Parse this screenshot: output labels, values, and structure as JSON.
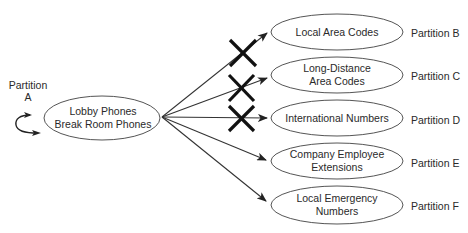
{
  "diagram": {
    "source": {
      "partition_label": [
        "Partition",
        "A"
      ],
      "lines": [
        "Lobby Phones",
        "Break Room Phones"
      ]
    },
    "targets": [
      {
        "lines": [
          "Local Area Codes"
        ],
        "partition": "Partition B",
        "blocked": true
      },
      {
        "lines": [
          "Long-Distance",
          "Area Codes"
        ],
        "partition": "Partition C",
        "blocked": true
      },
      {
        "lines": [
          "International Numbers"
        ],
        "partition": "Partition D",
        "blocked": true
      },
      {
        "lines": [
          "Company Employee",
          "Extensions"
        ],
        "partition": "Partition E",
        "blocked": false
      },
      {
        "lines": [
          "Local Emergency",
          "Numbers"
        ],
        "partition": "Partition F",
        "blocked": false
      }
    ],
    "colors": {
      "stroke": "#555555",
      "arrow": "#333333",
      "block_mark": "#111111",
      "text": "#2a2a2a"
    }
  }
}
